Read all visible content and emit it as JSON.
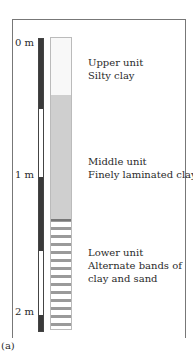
{
  "figure": {
    "caption": "(a)",
    "scale": {
      "ticks": [
        {
          "label": "0 m",
          "depth_m": 0
        },
        {
          "label": "1 m",
          "depth_m": 1
        },
        {
          "label": "2 m",
          "depth_m": 2
        }
      ]
    },
    "units": [
      {
        "name": "Upper unit",
        "description": "Silty clay",
        "fill": "#f8f8f8",
        "pattern": "speckled light"
      },
      {
        "name": "Middle unit",
        "description": "Finely laminated clay",
        "fill": "#cfcfcf",
        "pattern": "grey laminated"
      },
      {
        "name": "Lower unit",
        "description": "Alternate bands of",
        "description2": "clay and sand",
        "fill": "#9a9a9a",
        "pattern": "horizontal bands"
      }
    ]
  }
}
